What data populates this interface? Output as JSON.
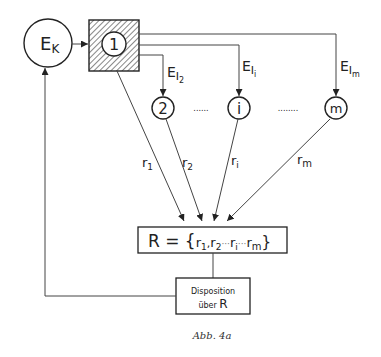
{
  "nodes": {
    "ek": {
      "main": "E",
      "sub": "K"
    },
    "n1": {
      "label": "1"
    },
    "n2": {
      "label": "2"
    },
    "ni": {
      "label": "i"
    },
    "nm": {
      "label": "m"
    }
  },
  "edges": {
    "e2": {
      "main": "E",
      "sub1": "I",
      "sub2": "2"
    },
    "ei": {
      "main": "E",
      "sub1": "I",
      "sub2": "i"
    },
    "em": {
      "main": "E",
      "sub1": "I",
      "sub2": "m"
    },
    "r1": {
      "main": "r",
      "sub": "1"
    },
    "r2": {
      "main": "r",
      "sub": "2"
    },
    "ri": {
      "main": "r",
      "sub": "i"
    },
    "rm": {
      "main": "r",
      "sub": "m"
    }
  },
  "ellipsis": {
    "left": "......",
    "right": "........"
  },
  "set_box": {
    "prefix": "R = {",
    "r1": "r",
    "r1_sub": "1",
    "sep1": ",",
    "r2": "r",
    "r2_sub": "2",
    "dots1": "···",
    "ri": "r",
    "ri_sub": "i",
    "dots2": "···",
    "rm": "r",
    "rm_sub": "m",
    "suffix": "}"
  },
  "disposition_box": {
    "line1": "Disposition",
    "line2_text": "über",
    "line2_var": "R"
  },
  "caption": "Abb. 4a"
}
